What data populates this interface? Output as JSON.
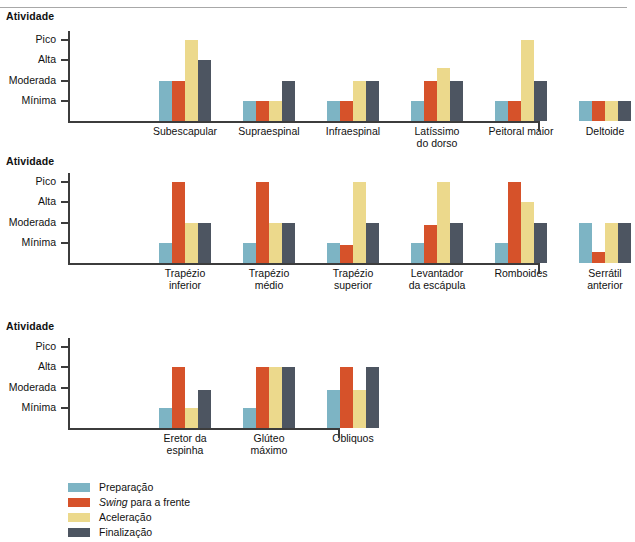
{
  "figure": {
    "axis_title": "Atividade",
    "y_categories": [
      "Pico",
      "Alta",
      "Moderada",
      "Mínima"
    ]
  },
  "legend": {
    "items": [
      {
        "label": "Preparação",
        "color": "#7db4c4",
        "italic_prefix": ""
      },
      {
        "label": "para a frente",
        "color": "#d6522a",
        "italic_prefix": "Swing"
      },
      {
        "label": "Aceleração",
        "color": "#ecd98c",
        "italic_prefix": ""
      },
      {
        "label": "Finalização",
        "color": "#4d5561",
        "italic_prefix": ""
      }
    ]
  },
  "colors": {
    "preparacao": "#7db4c4",
    "swing": "#d6522a",
    "aceleracao": "#ecd98c",
    "finalizacao": "#4d5561",
    "axis": "#3c3c3c",
    "rule": "#a8a8a8"
  },
  "chart_data": [
    {
      "type": "bar",
      "panel": 1,
      "title": "Atividade",
      "xlabel": "",
      "ylabel": "Atividade",
      "ytick_labels": [
        "Pico",
        "Alta",
        "Moderada",
        "Mínima"
      ],
      "ytick_values": [
        4,
        3,
        2,
        1
      ],
      "ylim": [
        0,
        4.45
      ],
      "grid": false,
      "legend_position": "bottom-left",
      "categories": [
        "Subescapular",
        "Supraespinal",
        "Infraespinal",
        "Latíssimo\ndo dorso",
        "Peitoral maior",
        "Deltoide"
      ],
      "series": [
        {
          "name": "Preparação",
          "color": "#7db4c4",
          "values": [
            2.0,
            1.0,
            1.0,
            1.0,
            1.0,
            1.0
          ]
        },
        {
          "name": "Swing para a frente",
          "color": "#d6522a",
          "values": [
            2.0,
            1.0,
            1.0,
            2.0,
            1.0,
            1.0
          ]
        },
        {
          "name": "Aceleração",
          "color": "#ecd98c",
          "values": [
            4.0,
            1.0,
            2.0,
            2.6,
            4.0,
            1.0
          ]
        },
        {
          "name": "Finalização",
          "color": "#4d5561",
          "values": [
            3.0,
            2.0,
            2.0,
            2.0,
            2.0,
            1.0
          ]
        }
      ]
    },
    {
      "type": "bar",
      "panel": 2,
      "title": "Atividade",
      "xlabel": "",
      "ylabel": "Atividade",
      "ytick_labels": [
        "Pico",
        "Alta",
        "Moderada",
        "Mínima"
      ],
      "ytick_values": [
        4,
        3,
        2,
        1
      ],
      "ylim": [
        0,
        4.45
      ],
      "grid": false,
      "legend_position": "bottom-left",
      "categories": [
        "Trapézio\ninferior",
        "Trapézio\nmédio",
        "Trapézio\nsuperior",
        "Levantador\nda escápula",
        "Romboides",
        "Serrátil\nanterior"
      ],
      "series": [
        {
          "name": "Preparação",
          "color": "#7db4c4",
          "values": [
            1.0,
            1.0,
            1.0,
            1.0,
            1.0,
            2.0
          ]
        },
        {
          "name": "Swing para a frente",
          "color": "#d6522a",
          "values": [
            4.0,
            4.0,
            0.9,
            1.9,
            4.0,
            0.55
          ]
        },
        {
          "name": "Aceleração",
          "color": "#ecd98c",
          "values": [
            2.0,
            2.0,
            4.0,
            4.0,
            3.0,
            2.0
          ]
        },
        {
          "name": "Finalização",
          "color": "#4d5561",
          "values": [
            2.0,
            2.0,
            2.0,
            2.0,
            2.0,
            2.0
          ]
        }
      ]
    },
    {
      "type": "bar",
      "panel": 3,
      "title": "Atividade",
      "xlabel": "",
      "ylabel": "Atividade",
      "ytick_labels": [
        "Pico",
        "Alta",
        "Moderada",
        "Mínima"
      ],
      "ytick_values": [
        4,
        3,
        2,
        1
      ],
      "ylim": [
        0,
        4.45
      ],
      "grid": false,
      "legend_position": "bottom-left",
      "categories": [
        "Eretor da\nespinha",
        "Glúteo\nmáximo",
        "Obliquos"
      ],
      "series": [
        {
          "name": "Preparação",
          "color": "#7db4c4",
          "values": [
            1.0,
            1.0,
            1.9
          ]
        },
        {
          "name": "Swing para a frente",
          "color": "#d6522a",
          "values": [
            3.0,
            3.0,
            3.0
          ]
        },
        {
          "name": "Aceleração",
          "color": "#ecd98c",
          "values": [
            1.0,
            3.0,
            1.9
          ]
        },
        {
          "name": "Finalização",
          "color": "#4d5561",
          "values": [
            1.9,
            3.0,
            3.0
          ]
        }
      ]
    }
  ]
}
